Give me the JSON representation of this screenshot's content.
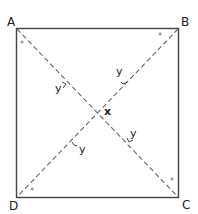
{
  "diagram": {
    "type": "square with diagonals",
    "vertices": {
      "A": "A",
      "B": "B",
      "C": "C",
      "D": "D"
    },
    "intersection_label": "x",
    "angle_labels": [
      "y",
      "y",
      "y",
      "y"
    ],
    "corner_marks": [
      "*",
      "*",
      "*",
      "*"
    ],
    "colors": {
      "square_stroke": "#444444",
      "diagonal_stroke": "#666666",
      "text": "#222222"
    }
  }
}
